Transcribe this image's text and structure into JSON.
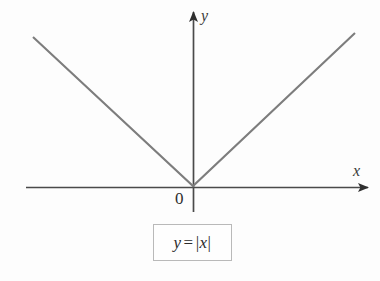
{
  "figure": {
    "background_color": "#fdfdfd",
    "width": 380,
    "height": 281
  },
  "axes": {
    "x_label": "x",
    "y_label": "y",
    "origin_label": "0",
    "axis_color": "#4a4a4a",
    "x_axis": {
      "x_start": 26,
      "x_end": 370,
      "y": 187
    },
    "y_axis": {
      "x": 193,
      "y_start": 10,
      "y_end": 212
    },
    "arrowheads": [
      "x-positive",
      "y-positive"
    ]
  },
  "equation": {
    "lhs": "y",
    "operator": "=",
    "abs_open": "|",
    "rhs": "x",
    "abs_close": "|",
    "full_text": "y = |x|",
    "border_color": "#b9b9b9"
  },
  "chart_data": {
    "type": "line",
    "title": "",
    "subtitle": "",
    "xlabel": "x",
    "ylabel": "y",
    "annotations": [
      "y = |x|",
      "0"
    ],
    "legend": [],
    "legend_position": "none",
    "grid": false,
    "series": [
      {
        "name": "y = |x|",
        "color": "#7d7d7d",
        "x": [
          -5.3,
          0,
          5.1
        ],
        "y": [
          4.97,
          0,
          5.1
        ],
        "points_px": [
          {
            "x": 33,
            "y": 37
          },
          {
            "x": 193,
            "y": 186
          },
          {
            "x": 355,
            "y": 33
          }
        ]
      }
    ],
    "xlim": [
      -5.6,
      5.9
    ],
    "ylim": [
      -0.85,
      5.9
    ]
  }
}
